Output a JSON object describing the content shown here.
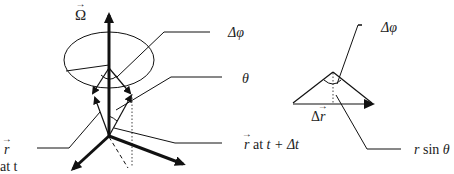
{
  "diagram": {
    "left_figure": {
      "labels": {
        "omega": "Ω",
        "delta_phi": "Δφ",
        "theta": "θ",
        "r_at_t_symbol": "r",
        "r_at_t_suffix": "at t",
        "r_at_t_dt_symbol": "r",
        "r_at_t_dt_mid": " at ",
        "r_at_t_dt_time": "t + Δt"
      }
    },
    "right_figure": {
      "labels": {
        "delta_phi": "Δφ",
        "delta_r_prefix": "Δ",
        "delta_r_symbol": "r",
        "r_sin_theta_r": "r",
        "r_sin_theta_rest": " sin ",
        "r_sin_theta_theta": "θ"
      }
    },
    "colors": {
      "stroke": "#111111",
      "background": "#ffffff"
    }
  }
}
